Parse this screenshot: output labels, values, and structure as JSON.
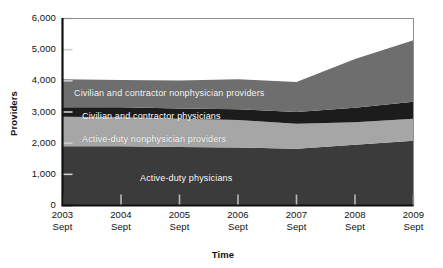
{
  "chart_data": {
    "type": "area",
    "stacked": true,
    "title": "",
    "subtitle": "",
    "xlabel": "Time",
    "ylabel": "Providers",
    "x": [
      "2003 Sept",
      "2004 Sept",
      "2005 Sept",
      "2006 Sept",
      "2007 Sept",
      "2008 Sept",
      "2009 Sept"
    ],
    "categories": [
      "2003\nSept",
      "2004\nSept",
      "2005\nSept",
      "2006\nSept",
      "2007\nSept",
      "2008\nSept",
      "2009\nSept"
    ],
    "ylim": [
      0,
      6000
    ],
    "yticks": [
      0,
      1000,
      2000,
      3000,
      4000,
      5000,
      6000
    ],
    "ytick_labels": [
      "0",
      "1,000",
      "2,000",
      "3,000",
      "4,000",
      "5,000",
      "6,000"
    ],
    "grid": false,
    "legend": "inline-band-labels",
    "series": [
      {
        "name": "Active-duty physicians",
        "color": "#3b3b3b",
        "values": [
          1900,
          1900,
          1880,
          1860,
          1820,
          1950,
          2080
        ]
      },
      {
        "name": "Active-duty nonphysician providers",
        "color": "#a6a6a6",
        "values": [
          950,
          930,
          900,
          880,
          800,
          720,
          700
        ]
      },
      {
        "name": "Civilian and contractor physicians",
        "color": "#1c1c1c",
        "values": [
          300,
          320,
          330,
          350,
          380,
          470,
          550
        ]
      },
      {
        "name": "Civilian and contractor nonphysician providers",
        "color": "#6e6e6e",
        "values": [
          900,
          880,
          900,
          960,
          960,
          1560,
          1970
        ]
      }
    ],
    "series_totals": [
      4050,
      4030,
      4010,
      4050,
      3960,
      4700,
      5300
    ],
    "colors": {
      "active_duty_physicians": "#3b3b3b",
      "active_duty_nonphysician": "#a6a6a6",
      "civilian_physicians": "#1c1c1c",
      "civilian_nonphysician": "#6e6e6e",
      "background": "#ffffff",
      "axis": "#1a1a1a",
      "label_text": "#ffffff"
    },
    "band_labels": [
      {
        "text": "Civilian and contractor nonphysician providers",
        "x": 74,
        "y": 88
      },
      {
        "text": "Civilian and contractor physicians",
        "x": 82,
        "y": 111
      },
      {
        "text": "Active-duty nonphysician providers",
        "x": 82,
        "y": 134
      },
      {
        "text": "Active-duty physicians",
        "x": 140,
        "y": 173
      }
    ]
  }
}
